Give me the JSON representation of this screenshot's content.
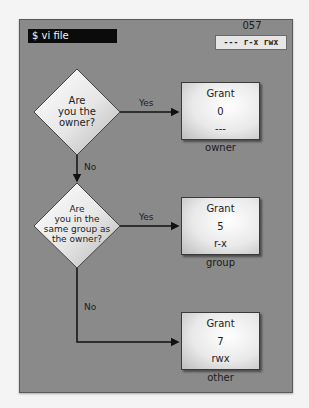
{
  "header": {
    "command": "$ vi file",
    "octal_mode": "057",
    "symbolic_mode": "--- r-x rwx"
  },
  "decisions": [
    {
      "lines": [
        "Are",
        "you the",
        "owner?"
      ]
    },
    {
      "lines": [
        "Are",
        "you in the",
        "same group as",
        "the owner?"
      ]
    }
  ],
  "edges": {
    "yes1": "Yes",
    "no1": "No",
    "yes2": "Yes",
    "no2": "No"
  },
  "outcomes": [
    {
      "title": "Grant",
      "octal": "0",
      "perms": "---",
      "label": "owner"
    },
    {
      "title": "Grant",
      "octal": "5",
      "perms": "r-x",
      "label": "group"
    },
    {
      "title": "Grant",
      "octal": "7",
      "perms": "rwx",
      "label": "other"
    }
  ],
  "colors": {
    "panel": "#8a8a8a",
    "terminal": "#0b0b0b",
    "lines": "#111111"
  }
}
